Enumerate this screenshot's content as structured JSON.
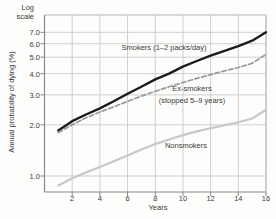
{
  "figure": {
    "log_scale_note": [
      "Log",
      "scale"
    ]
  },
  "chart_data": {
    "type": "line",
    "title": "",
    "y_scale": "log",
    "xlabel": "Years",
    "ylabel": "Annual probability of dying (%)",
    "x_ticks": [
      "2",
      "4",
      "6",
      "8",
      "10",
      "12",
      "14",
      "16"
    ],
    "y_ticks": [
      "1.0",
      "2.0",
      "3.0",
      "4.0",
      "5.0",
      "6.0",
      "7.0"
    ],
    "xlim": [
      0,
      16
    ],
    "ylim": [
      0.82,
      8.9
    ],
    "grid": true,
    "legend_position": "inline-labels",
    "x": [
      1,
      2,
      3,
      4,
      5,
      6,
      7,
      8,
      9,
      10,
      11,
      12,
      13,
      14,
      15,
      16
    ],
    "series": [
      {
        "name": "Smokers (1–2 packs/day)",
        "line_style": "solid",
        "color": "#1c1c1a",
        "values": [
          1.85,
          2.1,
          2.3,
          2.5,
          2.75,
          3.05,
          3.35,
          3.7,
          4.0,
          4.4,
          4.75,
          5.1,
          5.45,
          5.8,
          6.25,
          7.0
        ]
      },
      {
        "name": "Ex-smokers (stopped 5–9 years)",
        "line_style": "dashed",
        "color": "#98989a",
        "values": [
          1.8,
          2.0,
          2.2,
          2.38,
          2.55,
          2.75,
          2.95,
          3.15,
          3.35,
          3.55,
          3.75,
          3.95,
          4.15,
          4.35,
          4.6,
          5.2
        ]
      },
      {
        "name": "Nonsmokers",
        "line_style": "solid",
        "color": "#c7c9c6",
        "values": [
          0.88,
          0.97,
          1.05,
          1.13,
          1.22,
          1.32,
          1.43,
          1.54,
          1.64,
          1.74,
          1.83,
          1.91,
          1.99,
          2.07,
          2.18,
          2.45
        ]
      }
    ],
    "annotations": {
      "smokers": "Smokers (1–2 packs/day)",
      "ex_smokers_line1": "Ex-smokers",
      "ex_smokers_line2": "(stopped 5–9 years)",
      "nonsmokers": "Nonsmokers"
    }
  },
  "colors": {
    "background": "#fdfdfc",
    "grid": "#cdd0cd",
    "axis": "#85898a",
    "text": "#3b3b39"
  }
}
